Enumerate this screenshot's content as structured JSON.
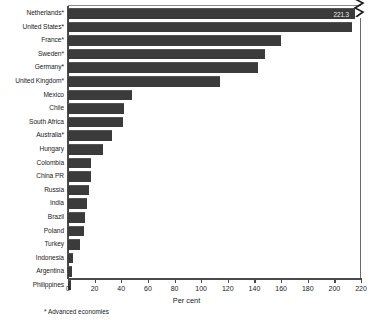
{
  "chart_data": {
    "type": "bar",
    "orientation": "horizontal",
    "title": "",
    "xlabel": "Per cent",
    "ylabel": "",
    "xlim": [
      0,
      220
    ],
    "xticks": [
      0,
      20,
      40,
      60,
      80,
      100,
      120,
      140,
      160,
      180,
      200,
      220
    ],
    "xtick_labels": [
      "0",
      "20",
      "40",
      "60",
      "80",
      "100",
      "120",
      "140",
      "160",
      "180",
      "200",
      "220"
    ],
    "grid": false,
    "legend": null,
    "axis_break": {
      "present": true,
      "series_index": 0,
      "category": "Netherlands*",
      "label": "221.3"
    },
    "footnote": "* Advanced economies",
    "bar_color": "#3b3b3b",
    "categories": [
      "Netherlands*",
      "United States*",
      "France*",
      "Sweden*",
      "Germany*",
      "United Kingdom*",
      "Mexico",
      "Chile",
      "South Africa",
      "Australia*",
      "Hungary",
      "Colombia",
      "China PR",
      "Russia",
      "India",
      "Brazil",
      "Poland",
      "Turkey",
      "Indonesia",
      "Argentina",
      "Philippines"
    ],
    "values": [
      221.3,
      213,
      160,
      148,
      143,
      114,
      48,
      42,
      41,
      33,
      26,
      17,
      17,
      16,
      14,
      13,
      12,
      9,
      4,
      3,
      2
    ]
  }
}
